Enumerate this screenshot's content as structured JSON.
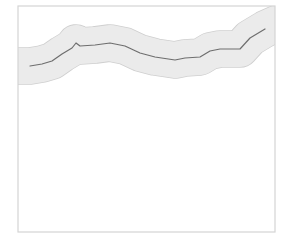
{
  "map": {
    "frame": {
      "x": 18,
      "y": 6,
      "width": 257,
      "height": 226,
      "stroke": "#d4d4d4",
      "fill": "#ffffff"
    },
    "buffer": {
      "fill": "#ebebeb",
      "edge": "#cfcfcf",
      "width": 36
    },
    "route": {
      "stroke": "#6e6e6e",
      "width": 1.2,
      "points": [
        [
          30,
          66
        ],
        [
          42,
          64
        ],
        [
          52,
          61
        ],
        [
          62,
          54
        ],
        [
          72,
          48
        ],
        [
          76,
          43
        ],
        [
          80,
          46
        ],
        [
          95,
          45
        ],
        [
          110,
          43
        ],
        [
          125,
          46
        ],
        [
          140,
          53
        ],
        [
          155,
          57
        ],
        [
          175,
          60
        ],
        [
          185,
          58
        ],
        [
          200,
          57
        ],
        [
          210,
          51
        ],
        [
          220,
          49
        ],
        [
          240,
          49
        ],
        [
          250,
          38
        ],
        [
          265,
          29
        ]
      ],
      "buffer_points": [
        [
          0,
          69
        ],
        [
          18,
          66
        ],
        [
          30,
          66
        ],
        [
          42,
          64
        ],
        [
          52,
          61
        ],
        [
          62,
          54
        ],
        [
          72,
          48
        ],
        [
          76,
          43
        ],
        [
          80,
          46
        ],
        [
          95,
          45
        ],
        [
          110,
          43
        ],
        [
          125,
          46
        ],
        [
          140,
          53
        ],
        [
          155,
          57
        ],
        [
          175,
          60
        ],
        [
          185,
          58
        ],
        [
          200,
          57
        ],
        [
          210,
          51
        ],
        [
          220,
          49
        ],
        [
          240,
          49
        ],
        [
          250,
          38
        ],
        [
          265,
          29
        ],
        [
          285,
          20
        ]
      ]
    }
  }
}
